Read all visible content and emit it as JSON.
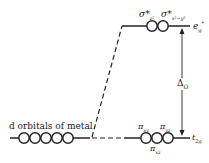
{
  "diagram": {
    "metal_label": "d orbitals of metal",
    "eg_top_labels": {
      "left": "σ*",
      "left_sub": "z²",
      "right": "σ*",
      "right_sub": "x²−y²"
    },
    "eg_label": "e",
    "eg_sub": "g",
    "eg_sup": "*",
    "t2g_labels": {
      "xy": "π",
      "xy_sub": "xy",
      "yz": "π",
      "yz_sub": "yz",
      "xz": "π",
      "xz_sub": "xz"
    },
    "t2g_label": "t",
    "t2g_sub": "2g",
    "delta_label": "Δ",
    "delta_sub": "O",
    "colors": {
      "line": "#222222",
      "background": "#ffffff"
    }
  }
}
